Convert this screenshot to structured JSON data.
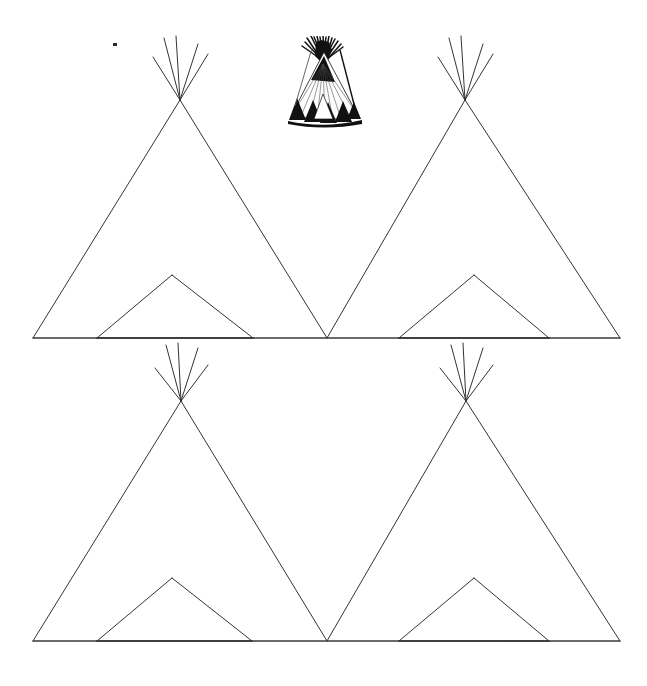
{
  "page": {
    "background_color": "#ffffff",
    "width": 647,
    "height": 686,
    "line_color": "#333333",
    "baseline_color": "#3a3a3a",
    "photo_ink_color": "#111111"
  },
  "artwork": {
    "description": "Four blank tipi outline drawings arranged in two rows of two, with a small black-and-white reference photograph of a decorated tipi centered at the top.",
    "rows": [
      {
        "name": "top-row",
        "baseline": {
          "x1": 33,
          "x2": 620,
          "y": 338
        },
        "tipis": [
          {
            "name": "tipi-outline-top-left",
            "apex": {
              "x": 180,
              "y": 100
            },
            "base_left": {
              "x": 33,
              "y": 338
            },
            "base_right": {
              "x": 327,
              "y": 338
            },
            "poles": [
              {
                "x1": 180,
                "y1": 100,
                "x2": 164,
                "y2": 38
              },
              {
                "x1": 180,
                "y1": 100,
                "x2": 176,
                "y2": 36
              },
              {
                "x1": 180,
                "y1": 100,
                "x2": 198,
                "y2": 44
              },
              {
                "x1": 180,
                "y1": 100,
                "x2": 153,
                "y2": 57
              },
              {
                "x1": 180,
                "y1": 100,
                "x2": 208,
                "y2": 54
              }
            ],
            "door": {
              "apex": {
                "x": 172,
                "y": 275
              },
              "base_left": {
                "x": 97,
                "y": 338
              },
              "base_right": {
                "x": 253,
                "y": 338
              }
            }
          },
          {
            "name": "tipi-outline-top-right",
            "apex": {
              "x": 465,
              "y": 100
            },
            "base_left": {
              "x": 327,
              "y": 338
            },
            "base_right": {
              "x": 620,
              "y": 338
            },
            "poles": [
              {
                "x1": 465,
                "y1": 100,
                "x2": 449,
                "y2": 38
              },
              {
                "x1": 465,
                "y1": 100,
                "x2": 461,
                "y2": 36
              },
              {
                "x1": 465,
                "y1": 100,
                "x2": 483,
                "y2": 44
              },
              {
                "x1": 465,
                "y1": 100,
                "x2": 438,
                "y2": 57
              },
              {
                "x1": 465,
                "y1": 100,
                "x2": 493,
                "y2": 54
              }
            ],
            "door": {
              "apex": {
                "x": 474,
                "y": 275
              },
              "base_left": {
                "x": 399,
                "y": 338
              },
              "base_right": {
                "x": 549,
                "y": 338
              }
            }
          }
        ]
      },
      {
        "name": "bottom-row",
        "baseline": {
          "x1": 33,
          "x2": 620,
          "y": 641
        },
        "tipis": [
          {
            "name": "tipi-outline-bottom-left",
            "apex": {
              "x": 181,
              "y": 401
            },
            "base_left": {
              "x": 33,
              "y": 641
            },
            "base_right": {
              "x": 327,
              "y": 641
            },
            "poles": [
              {
                "x1": 181,
                "y1": 401,
                "x2": 166,
                "y2": 345
              },
              {
                "x1": 181,
                "y1": 401,
                "x2": 178,
                "y2": 343
              },
              {
                "x1": 181,
                "y1": 401,
                "x2": 198,
                "y2": 348
              },
              {
                "x1": 181,
                "y1": 401,
                "x2": 155,
                "y2": 368
              },
              {
                "x1": 181,
                "y1": 401,
                "x2": 208,
                "y2": 365
              }
            ],
            "door": {
              "apex": {
                "x": 172,
                "y": 578
              },
              "base_left": {
                "x": 97,
                "y": 641
              },
              "base_right": {
                "x": 252,
                "y": 641
              }
            }
          },
          {
            "name": "tipi-outline-bottom-right",
            "apex": {
              "x": 466,
              "y": 401
            },
            "base_left": {
              "x": 327,
              "y": 641
            },
            "base_right": {
              "x": 620,
              "y": 641
            },
            "poles": [
              {
                "x1": 466,
                "y1": 401,
                "x2": 451,
                "y2": 345
              },
              {
                "x1": 466,
                "y1": 401,
                "x2": 463,
                "y2": 343
              },
              {
                "x1": 466,
                "y1": 401,
                "x2": 483,
                "y2": 348
              },
              {
                "x1": 466,
                "y1": 401,
                "x2": 440,
                "y2": 368
              },
              {
                "x1": 466,
                "y1": 401,
                "x2": 493,
                "y2": 365
              }
            ],
            "door": {
              "apex": {
                "x": 474,
                "y": 578
              },
              "base_left": {
                "x": 399,
                "y": 641
              },
              "base_right": {
                "x": 549,
                "y": 641
              }
            }
          }
        ]
      }
    ],
    "photo": {
      "name": "tipi-reference-photo",
      "bounds": {
        "x": 283,
        "y": 36,
        "width": 82,
        "height": 92
      },
      "caption": ""
    },
    "speck": {
      "x": 113,
      "y": 43,
      "width": 4,
      "height": 3
    }
  }
}
